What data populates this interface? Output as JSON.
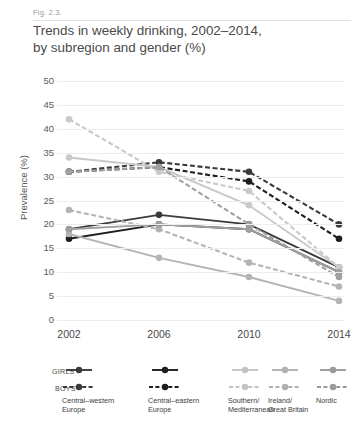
{
  "figure": {
    "caption": "Fig. 2.3.",
    "title_line1": "Trends in weekly drinking, 2002–2014,",
    "title_line2": "by subregion and gender (%)"
  },
  "legend": {
    "row_labels": {
      "girls": "GIRLS",
      "boys": "BOYS"
    },
    "entries": [
      {
        "name_line1": "Central–western",
        "name_line2": "Europe",
        "color": "#3a3a3a"
      },
      {
        "name_line1": "Central–eastern",
        "name_line2": "Europe",
        "color": "#1e1e1e"
      },
      {
        "name_line1": "Southern/",
        "name_line2": "Mediterranean",
        "color": "#c3c3c3"
      },
      {
        "name_line1": "Ireland/",
        "name_line2": "Great Britain",
        "color": "#b0b0b0"
      },
      {
        "name_line1": "Nordic",
        "name_line2": "",
        "color": "#9a9a9a"
      }
    ]
  },
  "chart_data": {
    "type": "line",
    "title": "Trends in weekly drinking, 2002–2014, by subregion and gender (%)",
    "xlabel": "",
    "ylabel": "Prevalence (%)",
    "x": [
      "2002",
      "2006",
      "2010",
      "2014"
    ],
    "categories": [
      "2002",
      "2006",
      "2010",
      "2014"
    ],
    "ylim": [
      0,
      50
    ],
    "yticks": [
      0,
      5,
      10,
      15,
      20,
      25,
      30,
      35,
      40,
      45,
      50
    ],
    "grid": true,
    "legend_position": "bottom",
    "series": [
      {
        "name": "Central–western Europe — GIRLS",
        "subregion": "Central–western Europe",
        "gender": "GIRLS",
        "style": "solid",
        "color": "#3a3a3a",
        "values": [
          19,
          22,
          20,
          11
        ]
      },
      {
        "name": "Central–western Europe — BOYS",
        "subregion": "Central–western Europe",
        "gender": "BOYS",
        "style": "dashed",
        "color": "#3a3a3a",
        "values": [
          31,
          33,
          31,
          20
        ]
      },
      {
        "name": "Central–eastern Europe — GIRLS",
        "subregion": "Central–eastern Europe",
        "gender": "GIRLS",
        "style": "solid",
        "color": "#1e1e1e",
        "values": [
          17,
          20,
          19,
          10
        ]
      },
      {
        "name": "Central–eastern Europe — BOYS",
        "subregion": "Central–eastern Europe",
        "gender": "BOYS",
        "style": "dashed",
        "color": "#1e1e1e",
        "values": [
          31,
          32,
          29,
          17
        ]
      },
      {
        "name": "Southern/Mediterranean — GIRLS",
        "subregion": "Southern/Mediterranean",
        "gender": "GIRLS",
        "style": "solid",
        "color": "#c9c9c9",
        "values": [
          34,
          32,
          24,
          11
        ]
      },
      {
        "name": "Southern/Mediterranean — BOYS",
        "subregion": "Southern/Mediterranean",
        "gender": "BOYS",
        "style": "dashed",
        "color": "#c9c9c9",
        "values": [
          42,
          31,
          27,
          11
        ]
      },
      {
        "name": "Ireland/Great Britain — GIRLS",
        "subregion": "Ireland/Great Britain",
        "gender": "GIRLS",
        "style": "solid",
        "color": "#b4b4b4",
        "values": [
          18,
          13,
          9,
          4
        ]
      },
      {
        "name": "Ireland/Great Britain — BOYS",
        "subregion": "Ireland/Great Britain",
        "gender": "BOYS",
        "style": "dashed",
        "color": "#b4b4b4",
        "values": [
          23,
          19,
          12,
          7
        ]
      },
      {
        "name": "Nordic — GIRLS",
        "subregion": "Nordic",
        "gender": "GIRLS",
        "style": "solid",
        "color": "#a0a0a0",
        "values": [
          19,
          20,
          19,
          10
        ]
      },
      {
        "name": "Nordic — BOYS",
        "subregion": "Nordic",
        "gender": "BOYS",
        "style": "dashed",
        "color": "#a0a0a0",
        "values": [
          31,
          32,
          20,
          9
        ]
      }
    ]
  }
}
